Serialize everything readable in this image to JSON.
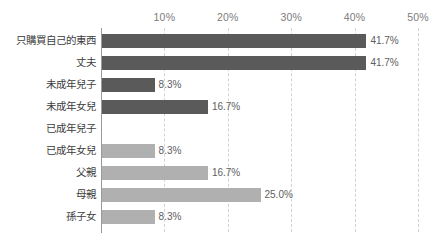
{
  "chart_data": {
    "type": "bar",
    "orientation": "horizontal",
    "title": "",
    "subtitle": "",
    "xlabel": "",
    "ylabel": "",
    "xlim": [
      0,
      50
    ],
    "grid": true,
    "legend": false,
    "axis_position": "top",
    "xticks": [
      "10%",
      "20%",
      "30%",
      "40%",
      "50%"
    ],
    "xtick_values": [
      10,
      20,
      30,
      40,
      50
    ],
    "categories": [
      "只購買自己的東西",
      "丈夫",
      "未成年兒子",
      "未成年女兒",
      "已成年兒子",
      "已成年女兒",
      "父親",
      "母親",
      "孫子女"
    ],
    "values": [
      41.7,
      41.7,
      8.3,
      16.7,
      0,
      8.3,
      16.7,
      25.0,
      8.3
    ],
    "value_labels": [
      "41.7%",
      "41.7%",
      "8.3%",
      "16.7%",
      "",
      "8.3%",
      "16.7%",
      "25.0%",
      "8.3%"
    ],
    "bar_colors": [
      "#5a5a5a",
      "#5a5a5a",
      "#5a5a5a",
      "#5a5a5a",
      "#5a5a5a",
      "#b0b0b0",
      "#b0b0b0",
      "#b0b0b0",
      "#b0b0b0"
    ]
  },
  "style": {
    "background": "#ffffff",
    "axis_color": "#9a9a9a",
    "gridline_color": "#d2d2d2",
    "tick_text_color": "#7c7c7c",
    "category_text_color": "#3d3d3d",
    "value_text_color": "#5e5e5e",
    "series_dark": "#5a5a5a",
    "series_light": "#b0b0b0"
  }
}
